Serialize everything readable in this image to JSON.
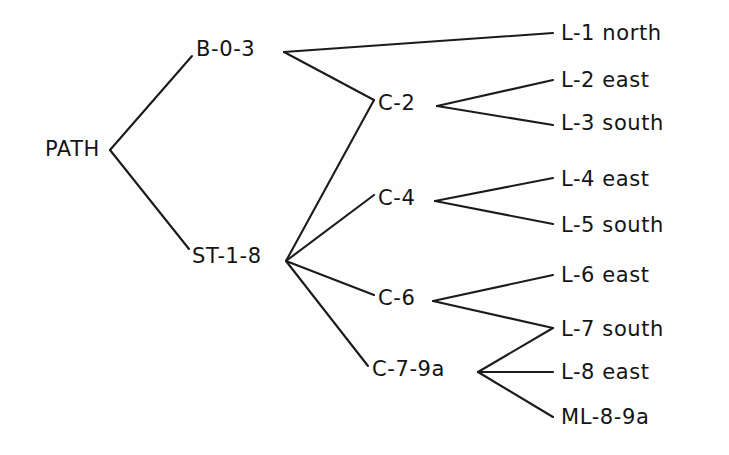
{
  "diagram": {
    "type": "tree",
    "orientation": "left-to-right",
    "canvas": {
      "width": 729,
      "height": 455
    },
    "style": {
      "background_color": "#fefefe",
      "line_color": "#1b1b1b",
      "text_color": "#141414",
      "line_width": 2.1,
      "font_size": 21
    },
    "nodes": [
      {
        "id": "path",
        "label": "PATH",
        "x": 100,
        "y": 150,
        "anchor": "end",
        "level": 0,
        "port_x": 110,
        "port_y": 150
      },
      {
        "id": "b03",
        "label": "B-0-3",
        "x": 196,
        "y": 50,
        "anchor": "start",
        "level": 1,
        "port_x": 284,
        "port_y": 52,
        "in_x": 192,
        "in_y": 56
      },
      {
        "id": "st18",
        "label": "ST-1-8",
        "x": 192,
        "y": 257,
        "anchor": "start",
        "level": 1,
        "port_x": 286,
        "port_y": 261,
        "in_x": 189,
        "in_y": 249
      },
      {
        "id": "c2",
        "label": "C-2",
        "x": 378,
        "y": 104,
        "anchor": "start",
        "level": 2,
        "port_x": 437,
        "port_y": 106,
        "in_x": 374,
        "in_y": 100
      },
      {
        "id": "c4",
        "label": "C-4",
        "x": 378,
        "y": 199,
        "anchor": "start",
        "level": 2,
        "port_x": 435,
        "port_y": 201,
        "in_x": 374,
        "in_y": 195
      },
      {
        "id": "c6",
        "label": "C-6",
        "x": 378,
        "y": 299,
        "anchor": "start",
        "level": 2,
        "port_x": 433,
        "port_y": 301,
        "in_x": 374,
        "in_y": 295
      },
      {
        "id": "c79a",
        "label": "C-7-9a",
        "x": 372,
        "y": 370,
        "anchor": "start",
        "level": 2,
        "port_x": 478,
        "port_y": 372,
        "in_x": 368,
        "in_y": 366
      },
      {
        "id": "l1",
        "label": "L-1 north",
        "x": 561,
        "y": 34,
        "anchor": "start",
        "level": 3,
        "in_x": 553,
        "in_y": 33
      },
      {
        "id": "l2",
        "label": "L-2 east",
        "x": 561,
        "y": 81,
        "anchor": "start",
        "level": 3,
        "in_x": 553,
        "in_y": 80
      },
      {
        "id": "l3",
        "label": "L-3 south",
        "x": 561,
        "y": 124,
        "anchor": "start",
        "level": 3,
        "in_x": 553,
        "in_y": 125
      },
      {
        "id": "l4",
        "label": "L-4 east",
        "x": 561,
        "y": 180,
        "anchor": "start",
        "level": 3,
        "in_x": 553,
        "in_y": 178
      },
      {
        "id": "l5",
        "label": "L-5 south",
        "x": 561,
        "y": 226,
        "anchor": "start",
        "level": 3,
        "in_x": 553,
        "in_y": 224
      },
      {
        "id": "l6",
        "label": "L-6 east",
        "x": 561,
        "y": 276,
        "anchor": "start",
        "level": 3,
        "in_x": 553,
        "in_y": 275
      },
      {
        "id": "l7",
        "label": "L-7 south",
        "x": 561,
        "y": 330,
        "anchor": "start",
        "level": 3,
        "in_x": 553,
        "in_y": 328
      },
      {
        "id": "l8",
        "label": "L-8 east",
        "x": 561,
        "y": 373,
        "anchor": "start",
        "level": 3,
        "in_x": 553,
        "in_y": 372
      },
      {
        "id": "ml89a",
        "label": "ML-8-9a",
        "x": 561,
        "y": 418,
        "anchor": "start",
        "level": 3,
        "in_x": 553,
        "in_y": 417
      }
    ],
    "edges": [
      {
        "id": "e-path-b03",
        "from": "path",
        "to": "b03",
        "x1": 110,
        "y1": 150,
        "x2": 192,
        "y2": 56
      },
      {
        "id": "e-path-st18",
        "from": "path",
        "to": "st18",
        "x1": 110,
        "y1": 150,
        "x2": 189,
        "y2": 249
      },
      {
        "id": "e-b03-l1",
        "from": "b03",
        "to": "l1",
        "x1": 284,
        "y1": 52,
        "x2": 553,
        "y2": 33
      },
      {
        "id": "e-b03-c2",
        "from": "b03",
        "to": "c2",
        "x1": 284,
        "y1": 52,
        "x2": 374,
        "y2": 100
      },
      {
        "id": "e-c2-l2",
        "from": "c2",
        "to": "l2",
        "x1": 437,
        "y1": 106,
        "x2": 553,
        "y2": 80
      },
      {
        "id": "e-c2-l3",
        "from": "c2",
        "to": "l3",
        "x1": 437,
        "y1": 106,
        "x2": 553,
        "y2": 125
      },
      {
        "id": "e-st18-c2",
        "from": "st18",
        "to": "c2",
        "x1": 286,
        "y1": 261,
        "x2": 374,
        "y2": 100
      },
      {
        "id": "e-st18-c4",
        "from": "st18",
        "to": "c4",
        "x1": 286,
        "y1": 261,
        "x2": 374,
        "y2": 195
      },
      {
        "id": "e-st18-c6",
        "from": "st18",
        "to": "c6",
        "x1": 286,
        "y1": 261,
        "x2": 374,
        "y2": 295
      },
      {
        "id": "e-st18-c79a",
        "from": "st18",
        "to": "c79a",
        "x1": 286,
        "y1": 261,
        "x2": 368,
        "y2": 366
      },
      {
        "id": "e-c4-l4",
        "from": "c4",
        "to": "l4",
        "x1": 435,
        "y1": 201,
        "x2": 553,
        "y2": 178
      },
      {
        "id": "e-c4-l5",
        "from": "c4",
        "to": "l5",
        "x1": 435,
        "y1": 201,
        "x2": 553,
        "y2": 224
      },
      {
        "id": "e-c6-l6",
        "from": "c6",
        "to": "l6",
        "x1": 433,
        "y1": 301,
        "x2": 553,
        "y2": 275
      },
      {
        "id": "e-c6-l7",
        "from": "c6",
        "to": "l7",
        "x1": 433,
        "y1": 301,
        "x2": 553,
        "y2": 328
      },
      {
        "id": "e-c79a-l7",
        "from": "c79a",
        "to": "l7",
        "x1": 478,
        "y1": 372,
        "x2": 553,
        "y2": 328
      },
      {
        "id": "e-c79a-l8",
        "from": "c79a",
        "to": "l8",
        "x1": 478,
        "y1": 372,
        "x2": 553,
        "y2": 372
      },
      {
        "id": "e-c79a-ml89a",
        "from": "c79a",
        "to": "ml89a",
        "x1": 478,
        "y1": 372,
        "x2": 553,
        "y2": 417
      }
    ]
  }
}
